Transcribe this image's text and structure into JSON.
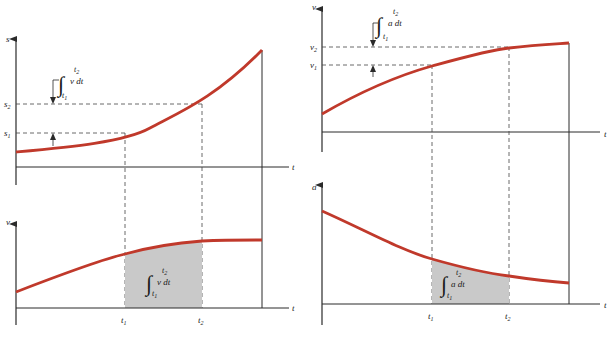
{
  "colors": {
    "background": "#ffffff",
    "axis": "#2a2a2a",
    "curve": "#c0392b",
    "shade": "#c9c9c9",
    "dashed": "#444444"
  },
  "panels": {
    "s_t": {
      "y_label": "s",
      "x_label": "t",
      "levels": [
        {
          "label": "s",
          "sub": "1"
        },
        {
          "label": "s",
          "sub": "2"
        }
      ],
      "integral": {
        "integrand": "v dt",
        "lower": "t",
        "lower_sub": "1",
        "upper": "t",
        "upper_sub": "2"
      }
    },
    "v_t_left": {
      "y_label": "v",
      "x_label": "t",
      "ticks": [
        {
          "label": "t",
          "sub": "1"
        },
        {
          "label": "t",
          "sub": "2"
        }
      ],
      "integral": {
        "integrand": "v dt",
        "lower": "t",
        "lower_sub": "1",
        "upper": "t",
        "upper_sub": "2"
      }
    },
    "v_t_right": {
      "y_label": "v",
      "x_label": "t",
      "levels": [
        {
          "label": "v",
          "sub": "1"
        },
        {
          "label": "v",
          "sub": "2"
        }
      ],
      "integral": {
        "integrand": "a dt",
        "lower": "t",
        "lower_sub": "1",
        "upper": "t",
        "upper_sub": "2"
      }
    },
    "a_t": {
      "y_label": "a",
      "x_label": "t",
      "ticks": [
        {
          "label": "t",
          "sub": "1"
        },
        {
          "label": "t",
          "sub": "2"
        }
      ],
      "integral": {
        "integrand": "a dt",
        "lower": "t",
        "lower_sub": "1",
        "upper": "t",
        "upper_sub": "2"
      }
    }
  }
}
